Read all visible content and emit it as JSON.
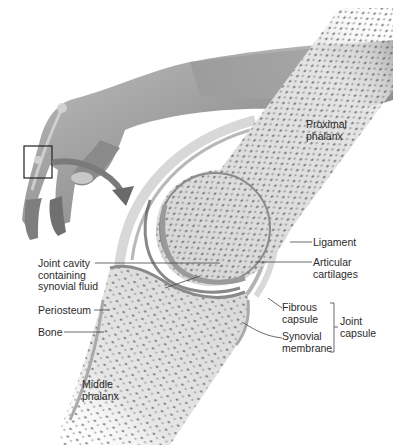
{
  "figure": {
    "colors": {
      "background": "#ffffff",
      "skin": "#9a9a9a",
      "bone": "#dcdcdc",
      "spongy_bone": "#4a4a4a",
      "cartilage": "#c8c8c8",
      "capsule": "#b0b0b0",
      "label_text": "#2b2b2b",
      "leader_line": "#444444"
    }
  },
  "labels": {
    "proximal_phalanx": "Proximal\nphalanx",
    "ligament": "Ligament",
    "articular_cartilages": "Articular\ncartilages",
    "joint_cavity": "Joint cavity\ncontaining\nsynovial fluid",
    "periosteum": "Periosteum",
    "bone": "Bone",
    "middle_phalanx": "Middle\nphalanx",
    "fibrous_capsule": "Fibrous\ncapsule",
    "synovial_membrane": "Synovial\nmembrane",
    "joint_capsule": "Joint\ncapsule"
  },
  "icons": {
    "hand": "hand-illustration",
    "zoom_box": "magnify-box",
    "arrow": "curved-arrow"
  }
}
